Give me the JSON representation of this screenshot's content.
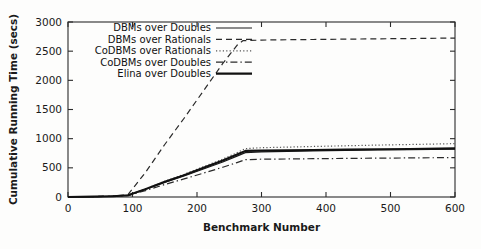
{
  "chart_data": {
    "type": "line",
    "title": "",
    "xlabel": "Benchmark Number",
    "ylabel": "Cumulative Running Time (secs)",
    "xlim": [
      0,
      600
    ],
    "ylim": [
      0,
      3000
    ],
    "xticks": [
      0,
      100,
      200,
      300,
      400,
      500,
      600
    ],
    "yticks": [
      0,
      500,
      1000,
      1500,
      2000,
      2500,
      3000
    ],
    "grid": false,
    "legend_position": "top-left-inside",
    "series": [
      {
        "name": "DBMs over Doubles",
        "style": "solid",
        "color": "#1a1a1a",
        "width": 1.2,
        "x": [
          0,
          40,
          70,
          93,
          120,
          150,
          180,
          210,
          240,
          262,
          275,
          300,
          340,
          380,
          430,
          480,
          530,
          600
        ],
        "values": [
          0,
          6,
          14,
          28,
          130,
          250,
          360,
          480,
          600,
          700,
          760,
          775,
          782,
          790,
          798,
          806,
          812,
          822
        ]
      },
      {
        "name": "DBMs over Rationals",
        "style": "dashed",
        "color": "#2a2a2a",
        "width": 1.2,
        "x": [
          0,
          40,
          70,
          93,
          120,
          150,
          180,
          210,
          240,
          262,
          271,
          300,
          340,
          380,
          430,
          480,
          530,
          600
        ],
        "values": [
          0,
          8,
          18,
          40,
          420,
          900,
          1350,
          1820,
          2290,
          2600,
          2680,
          2690,
          2696,
          2700,
          2706,
          2712,
          2716,
          2725
        ]
      },
      {
        "name": "CoDBMs over Rationals",
        "style": "dotted",
        "color": "#555555",
        "width": 1.2,
        "x": [
          0,
          40,
          70,
          93,
          120,
          150,
          180,
          210,
          240,
          262,
          275,
          300,
          340,
          380,
          430,
          480,
          530,
          600
        ],
        "values": [
          0,
          7,
          15,
          30,
          140,
          270,
          390,
          520,
          650,
          760,
          830,
          845,
          855,
          866,
          878,
          890,
          900,
          915
        ]
      },
      {
        "name": "CoDBMs over Doubles",
        "style": "dashdot",
        "color": "#2a2a2a",
        "width": 1.2,
        "x": [
          0,
          40,
          70,
          93,
          120,
          150,
          180,
          210,
          240,
          262,
          275,
          300,
          340,
          380,
          430,
          480,
          530,
          600
        ],
        "values": [
          0,
          5,
          12,
          24,
          110,
          215,
          310,
          410,
          510,
          590,
          640,
          648,
          652,
          657,
          661,
          666,
          670,
          676
        ]
      },
      {
        "name": "Elina over Doubles",
        "style": "solid-thick",
        "color": "#111111",
        "width": 2.1,
        "x": [
          0,
          40,
          70,
          93,
          120,
          150,
          180,
          210,
          240,
          262,
          275,
          300,
          340,
          380,
          430,
          480,
          530,
          600
        ],
        "values": [
          0,
          6,
          14,
          29,
          135,
          260,
          375,
          500,
          625,
          730,
          790,
          795,
          800,
          806,
          812,
          818,
          824,
          833
        ]
      }
    ]
  },
  "legend": {
    "entries": [
      {
        "label": "DBMs over Doubles"
      },
      {
        "label": "DBMs over Rationals"
      },
      {
        "label": "CoDBMs over Rationals"
      },
      {
        "label": "CoDBMs over Doubles"
      },
      {
        "label": "Elina over Doubles"
      }
    ]
  },
  "axes": {
    "y_title": "Cumulative Running Time (secs)",
    "x_title": "Benchmark Number",
    "y_tick_labels": [
      "0",
      "500",
      "1000",
      "1500",
      "2000",
      "2500",
      "3000"
    ],
    "x_tick_labels": [
      "0",
      "100",
      "200",
      "300",
      "400",
      "500",
      "600"
    ]
  },
  "colors": {
    "axis": "#2b2b2b",
    "text": "#1a1a1a",
    "background": "#fdfdfc"
  }
}
